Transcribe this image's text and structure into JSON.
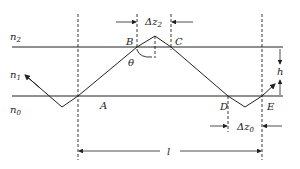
{
  "diagram": {
    "media": [
      {
        "name": "n",
        "sub": "2"
      },
      {
        "name": "n",
        "sub": "1"
      },
      {
        "name": "n",
        "sub": "0"
      }
    ],
    "points": {
      "A": "A",
      "B": "B",
      "C": "C",
      "D": "D",
      "E": "E"
    },
    "angle": "θ",
    "dims": {
      "top_shift": {
        "name": "Δz",
        "sub": "2"
      },
      "bottom_shift": {
        "name": "Δz",
        "sub": "0"
      },
      "thickness": "h",
      "length": "l"
    },
    "colors": {
      "line": "#222222",
      "background": "#ffffff"
    }
  }
}
